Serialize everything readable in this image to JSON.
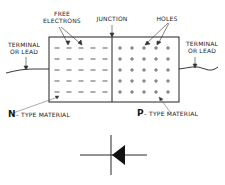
{
  "labels": {
    "free_electrons_line1": "FREE",
    "free_electrons_line2": "ELECTRONS",
    "junction": "JUNCTION",
    "holes": "HOLES",
    "terminal_left_line1": "TERMINAL",
    "terminal_left_line2": "OR LEAD",
    "terminal_right_line1": "TERMINAL",
    "terminal_right_line2": "OR LEAD",
    "n_letter": "N",
    "n_rest": "– TYPE MATERIAL",
    "p_letter": "P",
    "p_rest": "– TYPE MATERIAL"
  },
  "carriers": {
    "n_region_symbol": "–",
    "p_region_symbol": "+",
    "rows": 5,
    "cols": 5
  },
  "symbol": {
    "name": "diode-schematic-symbol"
  }
}
